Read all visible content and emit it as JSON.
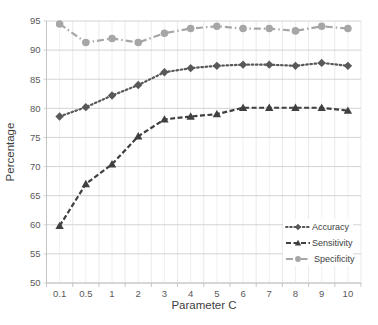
{
  "chart_data": {
    "type": "line",
    "title": "",
    "xlabel": "Parameter C",
    "ylabel": "Percentage",
    "categories": [
      "0.1",
      "0.5",
      "1",
      "2",
      "3",
      "4",
      "5",
      "6",
      "7",
      "8",
      "9",
      "10"
    ],
    "ylim": [
      50,
      95
    ],
    "yticks": [
      50,
      55,
      60,
      65,
      70,
      75,
      80,
      85,
      90,
      95
    ],
    "grid": true,
    "legend_position": "lower right, inside plot",
    "series": [
      {
        "name": "Accuracy",
        "marker": "diamond",
        "line_style": "dotted",
        "color": "#595959",
        "values": [
          78.6,
          80.2,
          82.2,
          84.0,
          86.2,
          86.9,
          87.3,
          87.5,
          87.5,
          87.3,
          87.8,
          87.3
        ]
      },
      {
        "name": "Sensitivity",
        "marker": "triangle",
        "line_style": "dashed",
        "color": "#404040",
        "values": [
          59.8,
          67.0,
          70.4,
          75.2,
          78.1,
          78.6,
          79.0,
          80.1,
          80.1,
          80.1,
          80.1,
          79.6
        ]
      },
      {
        "name": "Specificity",
        "marker": "circle",
        "line_style": "dash-dot",
        "color": "#a6a6a6",
        "values": [
          94.5,
          91.3,
          92.0,
          91.3,
          92.9,
          93.7,
          94.1,
          93.7,
          93.7,
          93.3,
          94.1,
          93.7
        ]
      }
    ]
  },
  "legend": {
    "items": [
      {
        "label": "Accuracy"
      },
      {
        "label": "Sensitivity"
      },
      {
        "label": "Specificity"
      }
    ]
  }
}
